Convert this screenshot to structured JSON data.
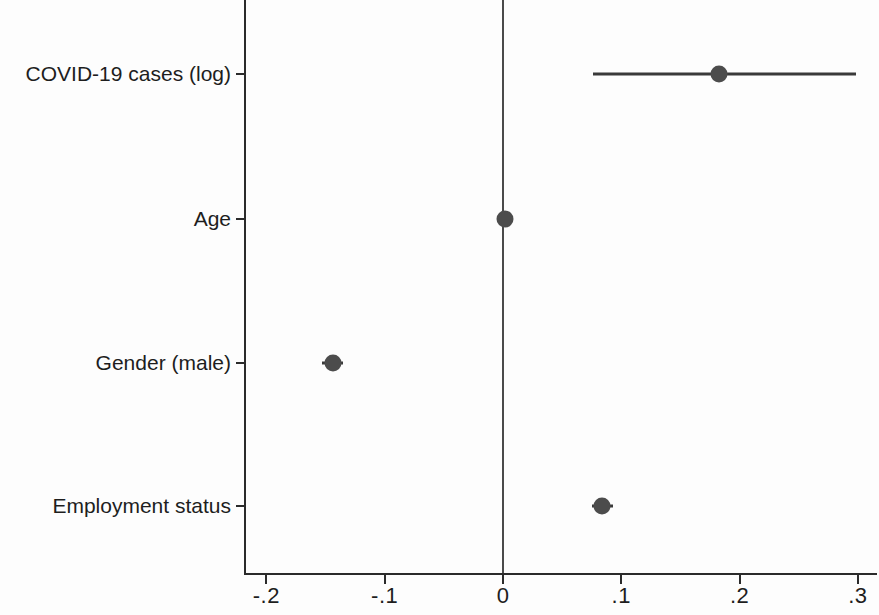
{
  "chart_data": {
    "type": "scatter",
    "plot_style": "coefficient-plot",
    "title": "",
    "xlabel": "",
    "ylabel": "",
    "xlim": [
      -0.23,
      0.33
    ],
    "ylim_categories_top_to_bottom": true,
    "grid": false,
    "legend": null,
    "reference_line_x": 0,
    "x_ticks": [
      {
        "value": -0.2,
        "label": "-.2"
      },
      {
        "value": -0.1,
        "label": "-.1"
      },
      {
        "value": 0,
        "label": "0"
      },
      {
        "value": 0.1,
        "label": ".1"
      },
      {
        "value": 0.2,
        "label": ".2"
      },
      {
        "value": 0.3,
        "label": ".3"
      }
    ],
    "categories": [
      "COVID-19 cases (log)",
      "Age",
      "Gender (male)",
      "Employment status"
    ],
    "values": [
      0.183,
      0.002,
      -0.144,
      0.084
    ],
    "ci_low": [
      0.076,
      -0.004,
      -0.153,
      0.075
    ],
    "ci_high": [
      0.298,
      0.008,
      -0.135,
      0.093
    ],
    "points": [
      {
        "label": "COVID-19 cases (log)",
        "estimate": 0.183,
        "ci_low": 0.076,
        "ci_high": 0.298
      },
      {
        "label": "Age",
        "estimate": 0.002,
        "ci_low": -0.004,
        "ci_high": 0.008
      },
      {
        "label": "Gender (male)",
        "estimate": -0.144,
        "ci_low": -0.153,
        "ci_high": -0.135
      },
      {
        "label": "Employment status",
        "estimate": 0.084,
        "ci_low": 0.075,
        "ci_high": 0.093
      }
    ],
    "marker_color": "#4c4c4c",
    "ci_color": "#3a3a3a",
    "axis_color": "#2b2b2b"
  }
}
